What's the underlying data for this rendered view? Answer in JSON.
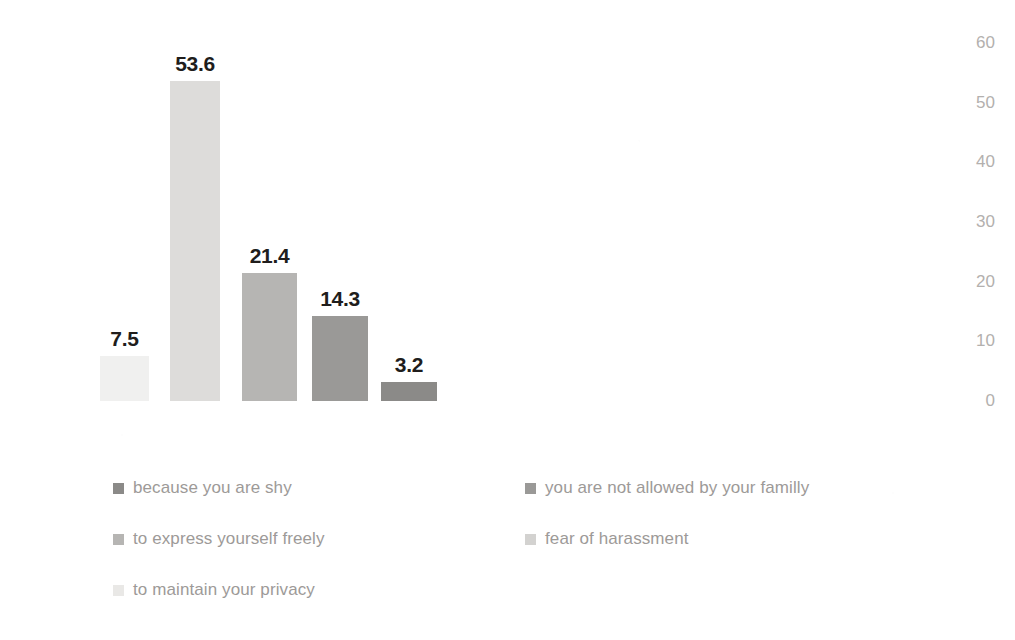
{
  "chart_data": {
    "type": "bar",
    "title": "",
    "subtitle": "",
    "xlabel": "",
    "ylabel": "",
    "grid": false,
    "legend_position": "bottom",
    "y_axis_position": "right",
    "ylim": [
      0,
      60
    ],
    "yticks": [
      "60",
      "50",
      "40",
      "30",
      "20",
      "10",
      "0"
    ],
    "ytick_values": [
      60,
      50,
      40,
      30,
      20,
      10,
      0
    ],
    "categories": [
      "because you are shy",
      "you are not allowed by your familly",
      "to express yourself freely",
      "fear of harassment",
      "to maintain your privacy"
    ],
    "values": [
      7.5,
      53.6,
      21.4,
      14.3,
      3.2
    ],
    "data_labels": [
      "7.5",
      "53.6",
      "21.4",
      "14.3",
      "3.2"
    ],
    "bar_colors": [
      "#f0f0ef",
      "#dddcda",
      "#b6b5b3",
      "#9a9997",
      "#8b8a88"
    ],
    "series": [
      {
        "name": "percentage",
        "values": [
          7.5,
          53.6,
          21.4,
          14.3,
          3.2
        ]
      }
    ]
  },
  "axis": {
    "ticks": [
      {
        "label": "60",
        "value": 60
      },
      {
        "label": "50",
        "value": 50
      },
      {
        "label": "40",
        "value": 40
      },
      {
        "label": "30",
        "value": 30
      },
      {
        "label": "20",
        "value": 20
      },
      {
        "label": "10",
        "value": 10
      },
      {
        "label": "0",
        "value": 0
      }
    ],
    "tick_color": "#b3b0ae"
  },
  "bars": [
    {
      "label": "7.5",
      "value": 7.5,
      "color": "#f0f0ef",
      "x": 100,
      "width": 49
    },
    {
      "label": "53.6",
      "value": 53.6,
      "color": "#dddcda",
      "x": 170,
      "width": 50
    },
    {
      "label": "21.4",
      "value": 21.4,
      "color": "#b6b5b3",
      "x": 242,
      "width": 55
    },
    {
      "label": "14.3",
      "value": 14.3,
      "color": "#9a9997",
      "x": 312,
      "width": 56
    },
    {
      "label": "3.2",
      "value": 3.2,
      "color": "#8b8a88",
      "x": 381,
      "width": 56
    }
  ],
  "legend": {
    "items": [
      {
        "label": "because you are shy",
        "color": "#8b8a88",
        "col": 0,
        "row": 0
      },
      {
        "label": "you are not allowed by your familly",
        "color": "#87standin",
        "col": 1,
        "row": 0
      },
      {
        "label": "to express yourself freely",
        "color": "#b0afad",
        "col": 0,
        "row": 1
      },
      {
        "label": "fear of harassment",
        "color": "#cfcecc",
        "col": 1,
        "row": 1
      },
      {
        "label": "to maintain your privacy",
        "color": "#e8e7e5",
        "col": 0,
        "row": 2
      }
    ],
    "label_color": "#9d9a98"
  },
  "colors": {
    "background": "#ffffff",
    "data_label": "#201d1c",
    "axis_label": "#b3b0ae",
    "legend_label": "#9d9a98"
  }
}
